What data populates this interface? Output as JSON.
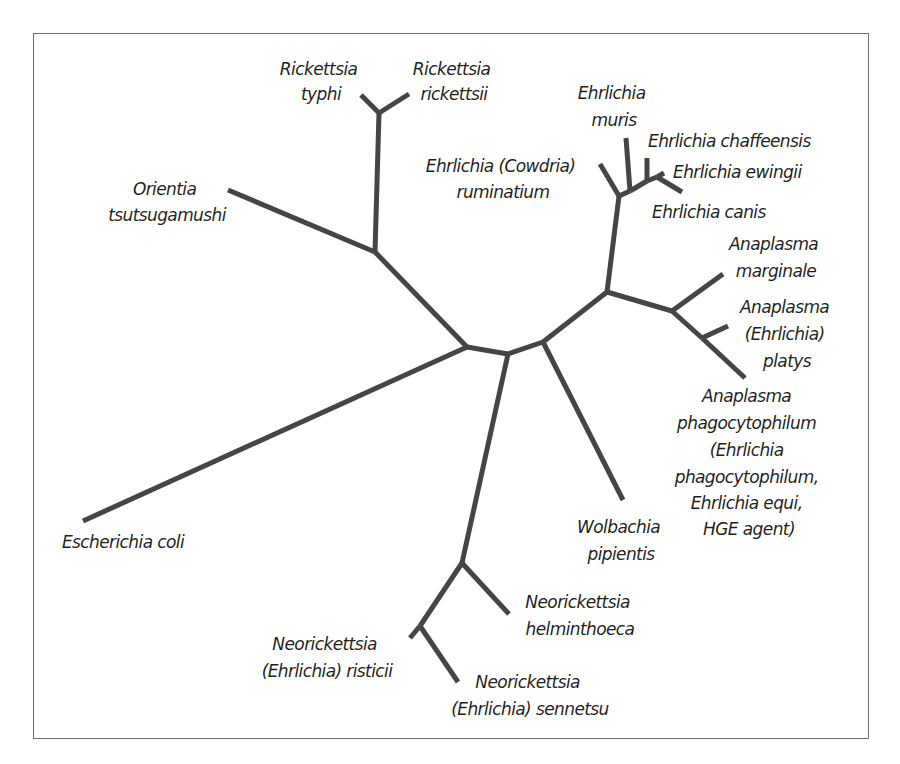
{
  "diagram": {
    "type": "unrooted phylogenetic tree",
    "stroke_color": "#454545",
    "text_color": "#1f1f1f",
    "border_color": "#6f6f6f"
  },
  "taxa": {
    "rickettsia_typhi": [
      "Rickettsia",
      "typhi"
    ],
    "rickettsia_rickettsii": [
      "Rickettsia",
      "rickettsii"
    ],
    "orientia": [
      "Orientia",
      "tsutsugamushi"
    ],
    "ehrlichia_muris": [
      "Ehrlichia",
      "muris"
    ],
    "ehrlichia_cowdria": [
      "Ehrlichia (Cowdria)",
      "ruminatium"
    ],
    "ehrlichia_chaffeensis": [
      "Ehrlichia chaffeensis"
    ],
    "ehrlichia_ewingii": [
      "Ehrlichia ewingii"
    ],
    "ehrlichia_canis": [
      "Ehrlichia canis"
    ],
    "anaplasma_marginale": [
      "Anaplasma",
      "marginale"
    ],
    "anaplasma_platys": [
      "Anaplasma",
      "(Ehrlichia)",
      "platys"
    ],
    "anaplasma_phagocytophilum": [
      "Anaplasma",
      "phagocytophilum",
      "(Ehrlichia",
      "phagocytophilum,",
      "Ehrlichia equi,",
      "HGE agent)"
    ],
    "wolbachia": [
      "Wolbachia",
      "pipientis"
    ],
    "escherichia_coli": [
      "Escherichia coli"
    ],
    "neorickettsia_helminthoeca": [
      "Neorickettsia",
      "helminthoeca"
    ],
    "neorickettsia_risticii": [
      "Neorickettsia",
      "(Ehrlichia) risticii"
    ],
    "neorickettsia_sennetsu": [
      "Neorickettsia",
      "(Ehrlichia) sennetsu"
    ]
  }
}
